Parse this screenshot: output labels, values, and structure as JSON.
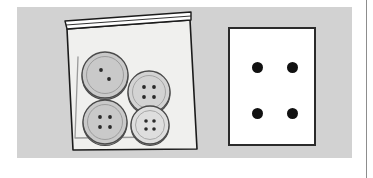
{
  "scene": {
    "width": 373,
    "height": 178,
    "background_color": "#ffffff",
    "panel": {
      "label": "illustration-panel",
      "color": "#d2d2d2",
      "x": 17,
      "y": 7,
      "width": 335,
      "height": 151
    },
    "page_rule": {
      "label": "page-edge-rule",
      "color": "#8d8d8d",
      "x": 366
    }
  },
  "bag": {
    "label": "plastic zip bag",
    "fill_color": "#f0f0ee",
    "outline_color": "#1b1b1b",
    "seam_color": "#9a9a9a",
    "seal": {
      "label": "zipper seal",
      "stripe_color": "#ffffff"
    },
    "buttons": [
      {
        "label": "button-top-left",
        "cx": 88,
        "cy": 68,
        "r": 23,
        "face_color": "#c9c9c9",
        "rim_color": "#b0b0b0",
        "outline_color": "#4a4a4a",
        "hole_color": "#2a2a2a",
        "holes_visible": 2,
        "holes": [
          {
            "dx": -4,
            "dy": -5
          },
          {
            "dx": 4,
            "dy": 4
          }
        ]
      },
      {
        "label": "button-top-right",
        "cx": 132,
        "cy": 85,
        "r": 21,
        "face_color": "#d3d3d3",
        "rim_color": "#b8b8b8",
        "outline_color": "#4a4a4a",
        "hole_color": "#2a2a2a",
        "holes_visible": 4,
        "holes": [
          {
            "dx": -5,
            "dy": -5
          },
          {
            "dx": 5,
            "dy": -5
          },
          {
            "dx": -5,
            "dy": 5
          },
          {
            "dx": 5,
            "dy": 5
          }
        ]
      },
      {
        "label": "button-bottom-left",
        "cx": 88,
        "cy": 115,
        "r": 22,
        "face_color": "#c9c9c9",
        "rim_color": "#b0b0b0",
        "outline_color": "#4a4a4a",
        "hole_color": "#2a2a2a",
        "holes_visible": 4,
        "holes": [
          {
            "dx": -5,
            "dy": -5
          },
          {
            "dx": 5,
            "dy": -5
          },
          {
            "dx": -5,
            "dy": 5
          },
          {
            "dx": 5,
            "dy": 5
          }
        ]
      },
      {
        "label": "button-bottom-right",
        "cx": 133,
        "cy": 118,
        "r": 19,
        "face_color": "#dedede",
        "rim_color": "#bdbdbd",
        "outline_color": "#4a4a4a",
        "hole_color": "#2a2a2a",
        "holes_visible": 4,
        "holes": [
          {
            "dx": -4,
            "dy": -4
          },
          {
            "dx": 4,
            "dy": -4
          },
          {
            "dx": -4,
            "dy": 4
          },
          {
            "dx": 4,
            "dy": 4
          }
        ]
      }
    ],
    "button_count": 4
  },
  "card": {
    "label": "white index card",
    "fill_color": "#ffffff",
    "border_color": "#2b2b2b",
    "dot_color": "#111111",
    "dot_count": 4,
    "dots": [
      {
        "label": "dot-top-left",
        "x": 22,
        "y": 33,
        "size": 11
      },
      {
        "label": "dot-top-right",
        "x": 57,
        "y": 33,
        "size": 11
      },
      {
        "label": "dot-bottom-left",
        "x": 22,
        "y": 79,
        "size": 11
      },
      {
        "label": "dot-bottom-right",
        "x": 57,
        "y": 79,
        "size": 11
      }
    ]
  }
}
